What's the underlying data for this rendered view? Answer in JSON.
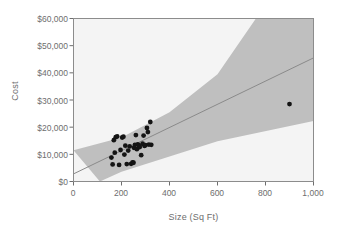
{
  "chart_data": {
    "type": "scatter",
    "title": "",
    "xlabel": "Size (Sq Ft)",
    "ylabel": "Cost",
    "xlim": [
      0,
      1000
    ],
    "ylim": [
      0,
      60000
    ],
    "grid": false,
    "legend": "none",
    "xticks": [
      0,
      200,
      400,
      600,
      800,
      1000
    ],
    "xtick_labels": [
      "0",
      "200",
      "400",
      "600",
      "800",
      "1,000"
    ],
    "yticks": [
      0,
      10000,
      20000,
      30000,
      40000,
      50000,
      60000
    ],
    "ytick_labels": [
      "$0",
      "$10,000",
      "$20,000",
      "$30,000",
      "$40,000",
      "$50,000",
      "$60,000"
    ],
    "series": [
      {
        "name": "Observations",
        "type": "scatter",
        "marker": "filled-circle",
        "color": "#141414",
        "points": [
          [
            158,
            8800
          ],
          [
            163,
            6300
          ],
          [
            168,
            15200
          ],
          [
            172,
            10600
          ],
          [
            176,
            16300
          ],
          [
            182,
            16600
          ],
          [
            190,
            6100
          ],
          [
            196,
            11600
          ],
          [
            203,
            16200
          ],
          [
            208,
            16500
          ],
          [
            212,
            9900
          ],
          [
            216,
            13200
          ],
          [
            222,
            6400
          ],
          [
            228,
            11400
          ],
          [
            234,
            12900
          ],
          [
            240,
            6500
          ],
          [
            246,
            7000
          ],
          [
            250,
            6900
          ],
          [
            252,
            12400
          ],
          [
            256,
            13500
          ],
          [
            260,
            17100
          ],
          [
            264,
            11900
          ],
          [
            268,
            13700
          ],
          [
            272,
            13300
          ],
          [
            276,
            12700
          ],
          [
            282,
            9700
          ],
          [
            288,
            13900
          ],
          [
            292,
            16900
          ],
          [
            296,
            13100
          ],
          [
            300,
            13400
          ],
          [
            306,
            19700
          ],
          [
            310,
            18200
          ],
          [
            314,
            13600
          ],
          [
            320,
            21900
          ],
          [
            324,
            13500
          ],
          [
            900,
            28500
          ]
        ]
      },
      {
        "name": "Regression line",
        "type": "line",
        "color": "#8c8c8c",
        "intercept": 2800,
        "slope_per_sqft": 42.7,
        "endpoints": [
          [
            0,
            2800
          ],
          [
            1000,
            45500
          ]
        ]
      },
      {
        "name": "Confidence band",
        "type": "band",
        "color": "#bfbfbf",
        "upper": [
          [
            0,
            11500
          ],
          [
            200,
            16200
          ],
          [
            400,
            25500
          ],
          [
            600,
            39500
          ],
          [
            760,
            60000
          ]
        ],
        "lower": [
          [
            110,
            0
          ],
          [
            200,
            3600
          ],
          [
            400,
            9200
          ],
          [
            600,
            14800
          ],
          [
            1000,
            22300
          ]
        ]
      }
    ]
  },
  "figure": {
    "background": "#ffffff",
    "plot_background": "#f4f4f4",
    "frame_color": "#8c8c8c",
    "tick_color": "#6e6e6e",
    "band_color": "#bfbfbf",
    "line_color": "#8a8a8a",
    "point_color": "#141414"
  }
}
